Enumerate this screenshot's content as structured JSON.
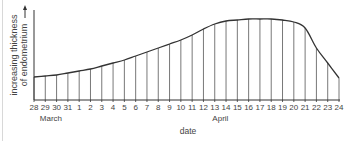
{
  "chart_data": {
    "type": "area",
    "title": "",
    "xlabel": "date",
    "ylabel": "increasing thickness of endometrium",
    "ylabel_lines": [
      "increasing thickness",
      "of endometrium"
    ],
    "categories": [
      "28",
      "29",
      "30",
      "31",
      "1",
      "2",
      "3",
      "4",
      "5",
      "6",
      "7",
      "8",
      "9",
      "10",
      "11",
      "12",
      "13",
      "14",
      "15",
      "16",
      "17",
      "18",
      "19",
      "20",
      "21",
      "22",
      "23",
      "24"
    ],
    "month_labels": [
      {
        "label": "March",
        "at_index": 1.5
      },
      {
        "label": "April",
        "at_index": 16.5
      }
    ],
    "values": [
      23,
      24,
      25,
      27,
      29,
      31,
      34,
      37,
      40,
      44,
      48,
      52,
      56,
      60,
      65,
      71,
      76,
      79,
      80,
      81,
      81,
      81,
      80,
      78,
      72,
      52,
      37,
      22
    ],
    "ylim": [
      0,
      92
    ],
    "y_ticks": "none (arrow indicates increasing)",
    "grid": false,
    "vertical_drop_lines": true,
    "legend": "none"
  },
  "colors": {
    "line": "#333333",
    "drop_lines": "#555555",
    "axis": "#333333",
    "text": "#444444"
  }
}
